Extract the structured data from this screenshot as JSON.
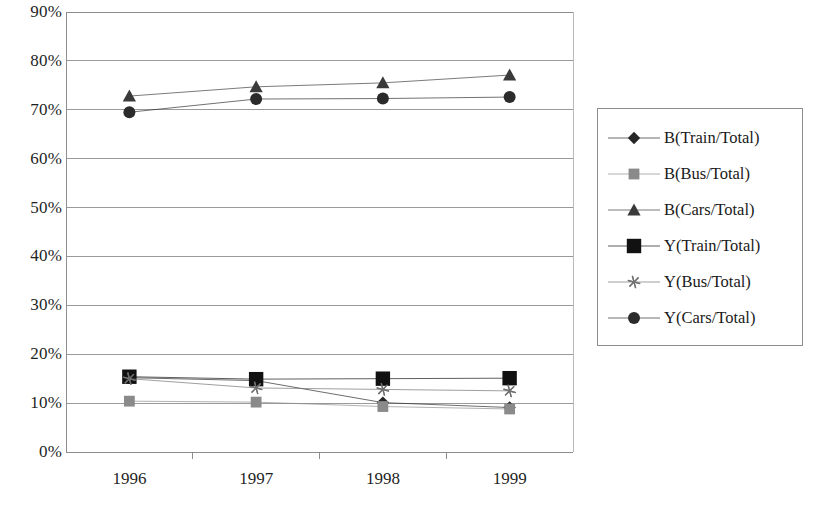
{
  "chart_data": {
    "type": "line",
    "title": "",
    "xlabel": "",
    "ylabel": "",
    "categories": [
      "1996",
      "1997",
      "1998",
      "1999"
    ],
    "ylim": [
      0,
      90
    ],
    "ytick_labels": [
      "0%",
      "10%",
      "20%",
      "30%",
      "40%",
      "50%",
      "60%",
      "70%",
      "80%",
      "90%"
    ],
    "ytick_values": [
      0,
      10,
      20,
      30,
      40,
      50,
      60,
      70,
      80,
      90
    ],
    "grid": "horizontal",
    "legend_position": "right",
    "series": [
      {
        "name": "B(Train/Total)",
        "marker": "diamond",
        "color": "#262626",
        "values": [
          15.2,
          14.6,
          10.1,
          9.1
        ]
      },
      {
        "name": "B(Bus/Total)",
        "marker": "square",
        "color": "#8a8a8a",
        "values": [
          10.4,
          10.2,
          9.3,
          8.8
        ]
      },
      {
        "name": "B(Cars/Total)",
        "marker": "triangle",
        "color": "#3a3a3a",
        "values": [
          72.8,
          74.7,
          75.5,
          77.1
        ]
      },
      {
        "name": "Y(Train/Total)",
        "marker": "big-square",
        "color": "#111111",
        "values": [
          15.4,
          14.9,
          15.0,
          15.1
        ]
      },
      {
        "name": "Y(Bus/Total)",
        "marker": "star",
        "color": "#707070",
        "values": [
          15.0,
          13.1,
          12.8,
          12.5
        ]
      },
      {
        "name": "Y(Cars/Total)",
        "marker": "circle",
        "color": "#2b2b2b",
        "values": [
          69.5,
          72.2,
          72.3,
          72.6
        ]
      }
    ]
  },
  "axes": {
    "plot_left": 66,
    "plot_right": 573,
    "plot_top": 12,
    "plot_bottom": 452
  },
  "colors": {
    "axis": "#8d8d8d",
    "grid": "#9a9a9a",
    "text": "#1a1a1a",
    "background": "#ffffff"
  }
}
